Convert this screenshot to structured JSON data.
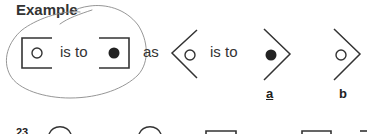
{
  "heading": "Example",
  "example": {
    "term1": {
      "shape": "open-bracket-square",
      "inner": "open-circle"
    },
    "connector1": "is to",
    "term2": {
      "shape": "close-bracket-square",
      "inner": "filled-circle"
    },
    "connector2": "as",
    "term3": {
      "shape": "open-chevron-left",
      "inner": "open-circle"
    },
    "connector3": "is to"
  },
  "options": [
    {
      "label": "a",
      "underlined": true,
      "shape": "chevron-right",
      "inner": "filled-circle"
    },
    {
      "label": "b",
      "underlined": false,
      "shape": "chevron-right",
      "inner": "open-circle"
    }
  ],
  "annotation": {
    "type": "hand-drawn-loop",
    "color": "#888888"
  },
  "next_question": {
    "number": "23",
    "visible_shapes": [
      "circle-top",
      "circle-top",
      "square-top",
      "square-top",
      "square-top-partial"
    ]
  },
  "colors": {
    "ink": "#333333",
    "pencil": "#8a8a8a",
    "background": "#ffffff"
  }
}
